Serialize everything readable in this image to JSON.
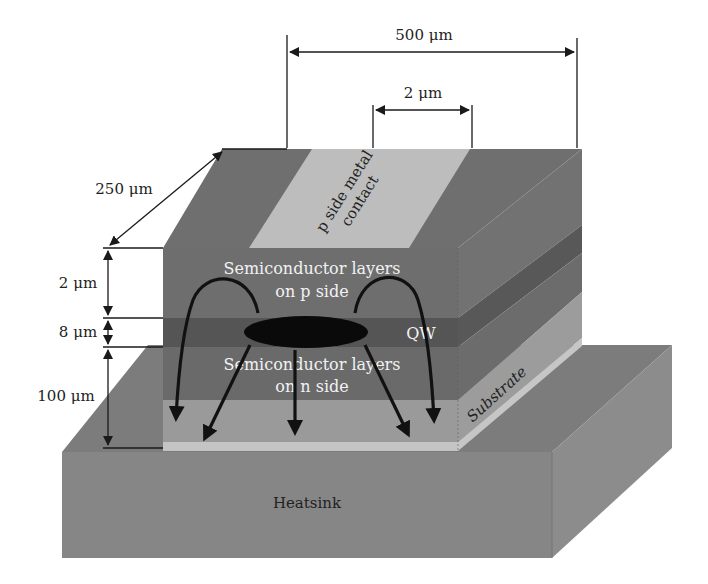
{
  "diagram": {
    "dimensions": {
      "length": "500 μm",
      "stripe_width": "2 μm",
      "width": "250 μm",
      "p_side_thickness": "2 μm",
      "qw_thickness": "8 μm",
      "n_side_thickness": "100 μm"
    },
    "labels": {
      "contact_line1": "p side metal",
      "contact_line2": "contact",
      "p_side_line1": "Semiconductor layers",
      "p_side_line2": "on p side",
      "qw": "QW",
      "n_side_line1": "Semiconductor layers",
      "n_side_line2": "on n side",
      "substrate": "Substrate",
      "heatsink": "Heatsink"
    },
    "colors": {
      "p_layer": "#6e6e6e",
      "qw_layer": "#555555",
      "n_layer": "#6a6a6a",
      "substrate": "#9a9a9a",
      "solder_strip": "#c4c4c4",
      "contact": "#bdbdbd",
      "heatsink_front": "#858585",
      "heatsink_top": "#7a7a7a",
      "heatsink_side": "#8a8a8a",
      "arrows": "#111111"
    }
  }
}
